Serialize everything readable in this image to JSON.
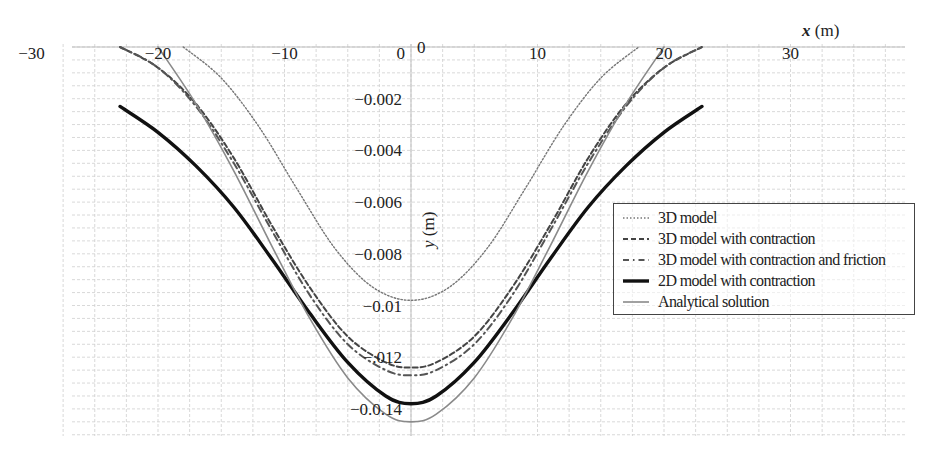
{
  "chart_data": {
    "type": "line",
    "title": "",
    "xlabel": "x (m)",
    "ylabel": "y (m)",
    "xlabel_var": "x",
    "xlabel_unit": "(m)",
    "ylabel_var": "y",
    "ylabel_unit": "(m)",
    "xlim": [
      -33,
      40
    ],
    "ylim": [
      -0.0155,
      0.0005
    ],
    "grid": true,
    "legend_position": "right-middle",
    "x_ticks": [
      {
        "value": -30,
        "label": "−30"
      },
      {
        "value": -20,
        "label": "−20"
      },
      {
        "value": -10,
        "label": "−10"
      },
      {
        "value": 0,
        "label": "0"
      },
      {
        "value": 10,
        "label": "10"
      },
      {
        "value": 20,
        "label": "20"
      },
      {
        "value": 30,
        "label": "30"
      }
    ],
    "y_ticks": [
      {
        "value": 0,
        "label": "0"
      },
      {
        "value": -0.002,
        "label": "−0.002"
      },
      {
        "value": -0.004,
        "label": "−0.004"
      },
      {
        "value": -0.006,
        "label": "−0.006"
      },
      {
        "value": -0.008,
        "label": "−0.008"
      },
      {
        "value": -0.01,
        "label": "−0.01"
      },
      {
        "value": -0.012,
        "label": "−.012"
      },
      {
        "value": -0.014,
        "label": "−0.0.14"
      }
    ],
    "series": [
      {
        "name": "3D model",
        "style": "dotted",
        "color": "#777777",
        "width": 1.4,
        "x": [
          -18,
          -15,
          -12,
          -9,
          -6,
          -3,
          0,
          3,
          6,
          9,
          12,
          15,
          18
        ],
        "values": [
          0.0,
          -0.0012,
          -0.0031,
          -0.0055,
          -0.0078,
          -0.0093,
          -0.0098,
          -0.0093,
          -0.0078,
          -0.0055,
          -0.0031,
          -0.0012,
          0.0
        ]
      },
      {
        "name": "3D model with contraction",
        "style": "dashed",
        "color": "#444444",
        "width": 2,
        "x": [
          -23,
          -20,
          -17,
          -14,
          -11,
          -8,
          -5,
          -2,
          0,
          2,
          5,
          8,
          11,
          14,
          17,
          20,
          23
        ],
        "values": [
          0.0,
          -0.0008,
          -0.0022,
          -0.0043,
          -0.0069,
          -0.0093,
          -0.0112,
          -0.0122,
          -0.0124,
          -0.0122,
          -0.0112,
          -0.0093,
          -0.0069,
          -0.0043,
          -0.0022,
          -0.0008,
          0.0
        ]
      },
      {
        "name": "3D model with contraction and friction",
        "style": "dashdot",
        "color": "#555555",
        "width": 2,
        "x": [
          -23,
          -20,
          -17,
          -14,
          -11,
          -8,
          -5,
          -2,
          0,
          2,
          5,
          8,
          11,
          14,
          17,
          20,
          23
        ],
        "values": [
          0.0,
          -0.0008,
          -0.0023,
          -0.0045,
          -0.0071,
          -0.0096,
          -0.0115,
          -0.0125,
          -0.0127,
          -0.0125,
          -0.0115,
          -0.0096,
          -0.0071,
          -0.0045,
          -0.0023,
          -0.0008,
          0.0
        ]
      },
      {
        "name": "2D model with contraction",
        "style": "solid",
        "color": "#111111",
        "width": 3.4,
        "x": [
          -23,
          -20,
          -17,
          -14,
          -11,
          -8,
          -5,
          -2,
          0,
          2,
          5,
          8,
          11,
          14,
          17,
          20,
          23
        ],
        "values": [
          -0.0023,
          -0.0033,
          -0.0046,
          -0.0062,
          -0.0082,
          -0.0103,
          -0.0122,
          -0.0135,
          -0.0138,
          -0.0135,
          -0.0122,
          -0.0103,
          -0.0082,
          -0.0062,
          -0.0046,
          -0.0033,
          -0.0023
        ]
      },
      {
        "name": "Analytical solution",
        "style": "solid",
        "color": "#8a8a8a",
        "width": 1.6,
        "x": [
          -20,
          -17,
          -14,
          -11,
          -8,
          -5,
          -2,
          0,
          2,
          5,
          8,
          11,
          14,
          17,
          20
        ],
        "values": [
          0.0,
          -0.0022,
          -0.0048,
          -0.0077,
          -0.0105,
          -0.0128,
          -0.0142,
          -0.0145,
          -0.0142,
          -0.0128,
          -0.0105,
          -0.0077,
          -0.0048,
          -0.0022,
          0.0
        ]
      }
    ]
  },
  "legend": {
    "items": [
      {
        "label": "3D model"
      },
      {
        "label": "3D model with contraction"
      },
      {
        "label": "3D model with contraction and friction"
      },
      {
        "label": "2D model with contraction"
      },
      {
        "label": "Analytical solution"
      }
    ]
  }
}
